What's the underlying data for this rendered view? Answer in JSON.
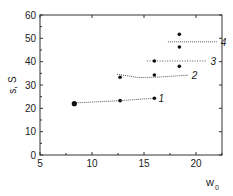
{
  "chart_data": {
    "type": "scatter",
    "title": "",
    "xlabel": "w",
    "xlabel_sub": "0",
    "ylabel": "s, S",
    "xlim": [
      5,
      22.5
    ],
    "ylim": [
      0,
      60
    ],
    "xticks": [
      5,
      10,
      15,
      20
    ],
    "yticks": [
      0,
      10,
      20,
      30,
      40,
      50,
      60
    ],
    "grid": false,
    "legend": "inline curve labels",
    "series": [
      {
        "name": "1",
        "points": [
          [
            8.3,
            22.0
          ],
          [
            12.7,
            23.3
          ],
          [
            16.0,
            24.3
          ]
        ],
        "line": [
          [
            8.3,
            22.3
          ],
          [
            12.7,
            23.3
          ],
          [
            16.0,
            24.3
          ]
        ],
        "style": "dotted-solid"
      },
      {
        "name": "2",
        "points": [
          [
            12.7,
            33.3
          ],
          [
            16.0,
            34.3
          ]
        ],
        "line": [
          [
            12.4,
            34.6
          ],
          [
            14.5,
            33.2
          ],
          [
            16.0,
            33.3
          ],
          [
            19.2,
            34.2
          ]
        ],
        "style": "dotted-solid"
      },
      {
        "name": "3",
        "points": [
          [
            16.0,
            40.3
          ],
          [
            18.4,
            38.0
          ]
        ],
        "line": [
          [
            15.3,
            40.3
          ],
          [
            21.0,
            40.3
          ]
        ],
        "style": "dotted"
      },
      {
        "name": "4",
        "points": [
          [
            18.4,
            51.7
          ],
          [
            18.4,
            46.3
          ]
        ],
        "line": [
          [
            17.3,
            48.5
          ],
          [
            22.0,
            48.5
          ]
        ],
        "style": "dotted-solid"
      }
    ]
  }
}
